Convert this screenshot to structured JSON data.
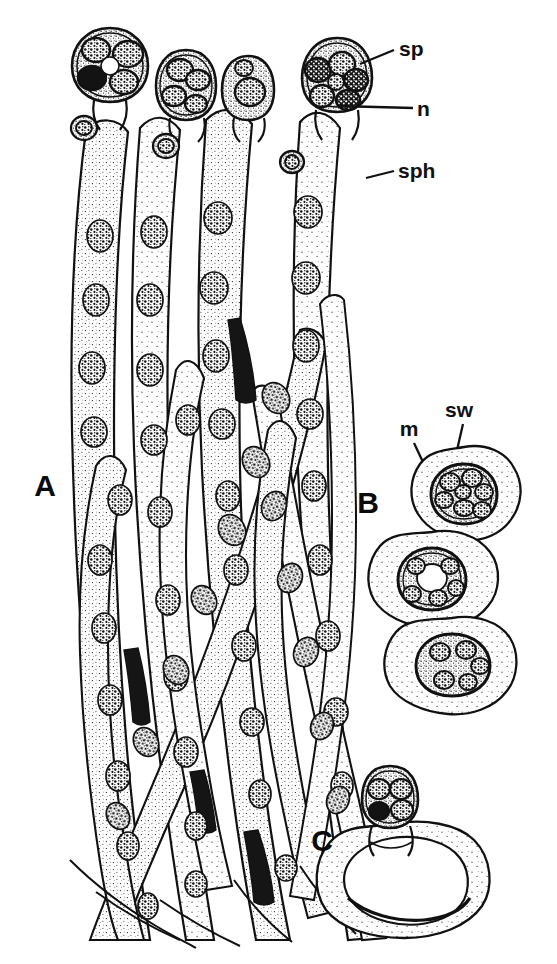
{
  "figure": {
    "background_color": "#ffffff",
    "ink_color": "#111111",
    "medium": "pen-and-ink stipple line drawing"
  },
  "panels": [
    {
      "id": "A",
      "letter": "A",
      "description": "Cluster of elongated intertwined sporangiophores (hyphae) with stippled cytoplasm and oval nuclei, each topped by a rounded sporangium containing dark spores",
      "letter_position": {
        "x": 45,
        "y": 496
      }
    },
    {
      "id": "B",
      "letter": "B",
      "description": "Three overlapping amoeboid cells, each enclosing a thick-walled spore with internal spore wall",
      "letter_position": {
        "x": 368,
        "y": 513
      }
    },
    {
      "id": "C",
      "letter": "C",
      "description": "Single amoeboid cell with a large vacuole bearing a small sporangium head with spores",
      "letter_position": {
        "x": 322,
        "y": 851
      }
    }
  ],
  "labels": [
    {
      "key": "sp",
      "text": "sp",
      "meaning": "spore",
      "text_position": {
        "x": 399,
        "y": 56
      },
      "leader": {
        "x1": 394,
        "y1": 50,
        "x2": 360,
        "y2": 64
      }
    },
    {
      "key": "n",
      "text": "n",
      "meaning": "nucleus",
      "text_position": {
        "x": 417,
        "y": 116
      },
      "leader": {
        "x1": 413,
        "y1": 108,
        "x2": 339,
        "y2": 106
      }
    },
    {
      "key": "sph",
      "text": "sph",
      "meaning": "sporangiophore",
      "text_position": {
        "x": 398,
        "y": 178
      },
      "leader": {
        "x1": 394,
        "y1": 171,
        "x2": 366,
        "y2": 178
      }
    },
    {
      "key": "m",
      "text": "m",
      "meaning": "matrix / amoeboid cell body",
      "text_position": {
        "x": 409,
        "y": 436
      },
      "leader": {
        "x1": 414,
        "y1": 443,
        "x2": 430,
        "y2": 473
      }
    },
    {
      "key": "sw",
      "text": "sw",
      "meaning": "spore wall",
      "text_position": {
        "x": 459,
        "y": 417
      },
      "leader": {
        "x1": 463,
        "y1": 424,
        "x2": 452,
        "y2": 470
      }
    }
  ],
  "panel_a": {
    "sporangia_heads": [
      {
        "cx": 110,
        "cy": 64,
        "rx": 34,
        "ry": 36,
        "spores": 5
      },
      {
        "cx": 186,
        "cy": 84,
        "rx": 27,
        "ry": 32,
        "spores": 4
      },
      {
        "cx": 248,
        "cy": 86,
        "rx": 25,
        "ry": 30,
        "spores": 2
      },
      {
        "cx": 337,
        "cy": 74,
        "rx": 33,
        "ry": 35,
        "spores": 6
      }
    ],
    "hyphae_count": 14,
    "nuclei_count_estimate": 62
  },
  "panel_b": {
    "cells": [
      {
        "cx": 464,
        "cy": 494,
        "rx": 56,
        "ry": 47,
        "inner_rx": 38,
        "inner_ry": 34,
        "spores": 7
      },
      {
        "cx": 432,
        "cy": 580,
        "rx": 60,
        "ry": 48,
        "inner_rx": 38,
        "inner_ry": 35,
        "spores": 5
      },
      {
        "cx": 452,
        "cy": 663,
        "rx": 58,
        "ry": 46,
        "inner_rx": 38,
        "inner_ry": 33,
        "spores": 5
      }
    ]
  },
  "panel_c": {
    "head": {
      "cx": 390,
      "cy": 796,
      "rx": 26,
      "ry": 28,
      "spores": 4
    },
    "body": {
      "cx": 395,
      "cy": 876,
      "rx": 62,
      "ry": 52
    }
  }
}
